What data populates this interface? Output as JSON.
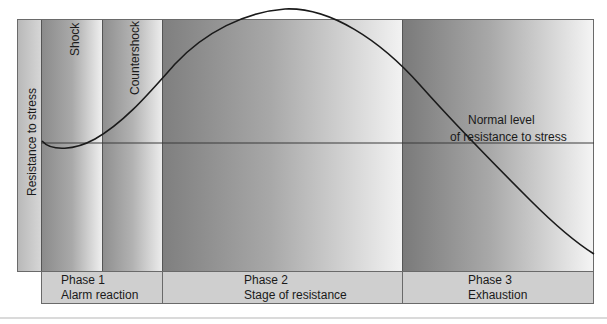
{
  "diagram": {
    "type": "general-adaptation-syndrome",
    "y_axis_label": "Resistance to stress",
    "column_labels": {
      "shock": "Shock",
      "countershock": "Countershock"
    },
    "baseline_label_line1": "Normal level",
    "baseline_label_line2": "of resistance to stress",
    "phases": [
      {
        "line1": "Phase 1",
        "line2": "Alarm reaction"
      },
      {
        "line1": "Phase 2",
        "line2": "Stage of resistance"
      },
      {
        "line1": "Phase 3",
        "line2": "Exhaustion"
      }
    ],
    "colors": {
      "curve": "#1a1a1a",
      "baseline": "#3a3a3a",
      "phase_row": "#cfcfcf",
      "border": "#6a6a6a"
    }
  }
}
